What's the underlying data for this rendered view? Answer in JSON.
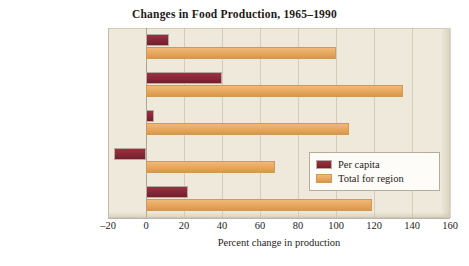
{
  "chart_data": {
    "type": "bar",
    "orientation": "horizontal",
    "title": "Changes in Food Production, 1965–1990",
    "xlabel": "Percent change in production",
    "ylabel": "",
    "categories": [
      "Latin America",
      "Asia",
      "Middle East",
      "Africa",
      "All of Third World"
    ],
    "series": [
      {
        "name": "Per capita",
        "color": "#8C2838",
        "values": [
          12,
          40,
          4,
          -17,
          22
        ]
      },
      {
        "name": "Total for region",
        "color": "#E8A860",
        "values": [
          100,
          135,
          107,
          68,
          119
        ]
      }
    ],
    "xlim": [
      -20,
      160
    ],
    "xticks": [
      -20,
      0,
      20,
      40,
      60,
      80,
      100,
      120,
      140,
      160
    ],
    "xtick_labels": [
      "–20",
      "0",
      "20",
      "40",
      "60",
      "80",
      "100",
      "120",
      "140",
      "160"
    ],
    "grid": true,
    "grid_axis": "x",
    "legend_position": "center-right",
    "plot_background": "#EFE9DC"
  },
  "legend": {
    "items": [
      {
        "label": "Per capita"
      },
      {
        "label": "Total for region"
      }
    ]
  }
}
